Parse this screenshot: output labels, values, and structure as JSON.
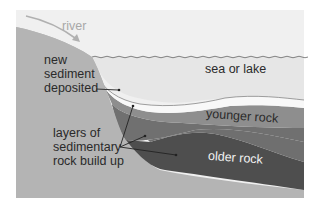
{
  "diagram": {
    "labels": {
      "river": "river",
      "sea": "sea or lake",
      "new_sediment": [
        "new",
        "sediment",
        "deposited"
      ],
      "layers": [
        "layers of",
        "sedimentary",
        "rock build up"
      ],
      "younger_rock": "younger rock",
      "older_rock": "older rock"
    },
    "colors": {
      "sky": "#f0f0f0",
      "land": "#b4b4b4",
      "water": "#e6e6e6",
      "new_sediment": "#f8f8f8",
      "younger_rock": "#8e8e8e",
      "middle_rock": "#6f6f6f",
      "older_rock": "#4e4e4e",
      "basement": "#bdbdbd",
      "label_text": "#2a2a2a",
      "river_text": "#a8a8a8"
    }
  }
}
